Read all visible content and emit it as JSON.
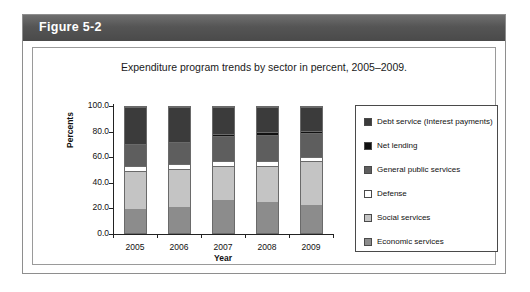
{
  "figure": {
    "number_label": "Figure 5-2",
    "caption": "Expenditure program trends by sector in percent, 2005–2009."
  },
  "chart_data": {
    "type": "bar",
    "title": "Expenditure program trends by sector in percent, 2005–2009.",
    "subtype": "stacked-100-percent",
    "xlabel": "Year",
    "ylabel": "Percents",
    "categories": [
      "2005",
      "2006",
      "2007",
      "2008",
      "2009"
    ],
    "ylim": [
      0,
      100
    ],
    "ytick_labels": [
      "0.0",
      "20.0",
      "40.0",
      "60.0",
      "80.0",
      "100.0"
    ],
    "ytick_values": [
      0,
      20,
      40,
      60,
      80,
      100
    ],
    "grid": false,
    "legend_position": "right",
    "series": [
      {
        "name": "Economic services",
        "color": "#8c8c8c",
        "values": [
          19,
          21,
          26,
          25,
          22
        ]
      },
      {
        "name": "Social services",
        "color": "#c4c4c4",
        "values": [
          30,
          30,
          27,
          28,
          35
        ]
      },
      {
        "name": "Defense",
        "color": "#ffffff",
        "values": [
          4,
          4,
          4,
          4,
          3
        ]
      },
      {
        "name": "General public services",
        "color": "#5e5e5e",
        "values": [
          18,
          17,
          20,
          21,
          19
        ]
      },
      {
        "name": "Net lending",
        "color": "#111111",
        "values": [
          0,
          0,
          2,
          2,
          2
        ]
      },
      {
        "name": "Debt service (Interest payments)",
        "color": "#3b3b3b",
        "values": [
          29,
          28,
          21,
          20,
          19
        ]
      }
    ]
  },
  "legend": {
    "items": [
      {
        "label": "Debt service (Interest payments)",
        "color": "#3b3b3b"
      },
      {
        "label": "Net lending",
        "color": "#111111"
      },
      {
        "label": "General public services",
        "color": "#5e5e5e"
      },
      {
        "label": "Defense",
        "color": "#ffffff"
      },
      {
        "label": "Social services",
        "color": "#c4c4c4"
      },
      {
        "label": "Economic services",
        "color": "#8c8c8c"
      }
    ]
  }
}
